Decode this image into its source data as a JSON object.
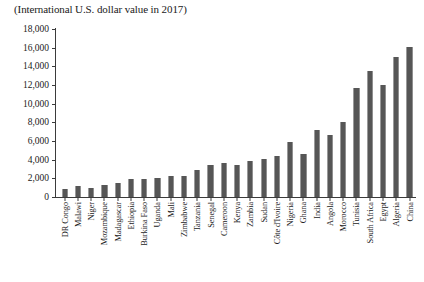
{
  "chart": {
    "title": "(International U.S. dollar value in 2017)"
  },
  "chart_data": {
    "type": "bar",
    "title": "(International U.S. dollar value in 2017)",
    "xlabel": "",
    "ylabel": "",
    "ylim": [
      0,
      18000
    ],
    "ytick_labels": [
      "18,000",
      "16,000",
      "14,000",
      "12,000",
      "10,000",
      "8,000",
      "6,000",
      "4,000",
      "2,000",
      "0"
    ],
    "ytick_values": [
      18000,
      16000,
      14000,
      12000,
      10000,
      8000,
      6000,
      4000,
      2000,
      0
    ],
    "grid": false,
    "legend": null,
    "bar_color": "#565656",
    "categories": [
      "DR Congo",
      "Malawi",
      "Niger",
      "Mozambique",
      "Madagascar",
      "Ethiopia",
      "Burkina Faso",
      "Uganda",
      "Mali",
      "Zimbabwe",
      "Tanzania",
      "Senegal",
      "Cameroon",
      "Kenya",
      "Zambia",
      "Sudan",
      "Côte d'Ivoire",
      "Nigeria",
      "Ghana",
      "India",
      "Angola",
      "Morocco",
      "Tunisia",
      "South Africa",
      "Egypt",
      "Algeria",
      "China"
    ],
    "values": [
      900,
      1200,
      1000,
      1250,
      1550,
      1900,
      1900,
      2000,
      2200,
      2300,
      2900,
      3400,
      3600,
      3400,
      3900,
      4100,
      4400,
      5900,
      4600,
      7200,
      6600,
      8000,
      11700,
      13500,
      12000,
      15000,
      16100
    ]
  }
}
